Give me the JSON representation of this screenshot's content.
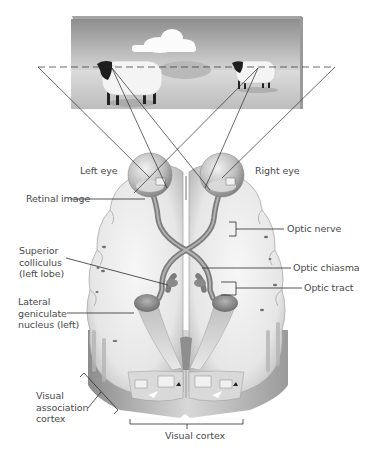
{
  "diagram": {
    "scene": {
      "description": "Painting of two sheep in a field with a cloud",
      "objects": [
        "cloud",
        "left-sheep",
        "right-sheep",
        "hill"
      ]
    },
    "labels": {
      "left_eye": "Left eye",
      "right_eye": "Right eye",
      "retinal_image": "Retinal image",
      "optic_nerve": "Optic nerve",
      "superior_colliculus": [
        "Superior",
        "colliculus",
        "(left lobe)"
      ],
      "optic_chiasma": "Optic chiasma",
      "optic_tract": "Optic tract",
      "lateral_geniculate": [
        "Lateral",
        "geniculate",
        "nucleus (left)"
      ],
      "visual_association": [
        "Visual",
        "association",
        "cortex"
      ],
      "visual_cortex": "Visual cortex"
    },
    "colors": {
      "line": "#2b2b2b",
      "label_text": "#4a4a4a",
      "brain_light": "#efefef",
      "brain_mid": "#cfcfcf",
      "brain_dark": "#8a8a8a",
      "nerve": "#8c8c8c",
      "sky_top": "#8f8f8f",
      "sky_bottom": "#d6d6d6"
    }
  }
}
